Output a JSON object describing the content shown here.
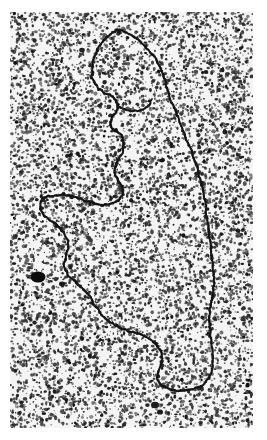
{
  "figure": {
    "kind": "electron-micrograph",
    "title": "",
    "caption": "",
    "background_color": "#ffffff",
    "plate_color": "#f4f4f4",
    "grain_color": "#111111",
    "filament_color": "#141414",
    "canvas": {
      "width": 267,
      "height": 440
    },
    "plate": {
      "x": 10,
      "y": 12,
      "width": 243,
      "height": 416
    }
  },
  "chart_data": {
    "type": "scatter",
    "xlabel": "",
    "ylabel": "",
    "grid": false,
    "legend": "none",
    "xlim": [
      0,
      243
    ],
    "ylim": [
      0,
      416
    ],
    "annotations": [
      "looped DNA filament",
      "top lobe loop",
      "left lower lobe loop",
      "long right arm",
      "dark stain aggregate",
      "granular stain background"
    ],
    "series": [
      {
        "name": "dna-filament-path",
        "type": "line",
        "color": "#141414",
        "width": 2.0,
        "points": [
          [
            108,
            18
          ],
          [
            101,
            22
          ],
          [
            94,
            28
          ],
          [
            88,
            36
          ],
          [
            84,
            45
          ],
          [
            82,
            55
          ],
          [
            82,
            64
          ],
          [
            85,
            72
          ],
          [
            90,
            78
          ],
          [
            96,
            82
          ],
          [
            102,
            84
          ],
          [
            106,
            88
          ],
          [
            108,
            94
          ],
          [
            106,
            100
          ],
          [
            102,
            104
          ],
          [
            100,
            110
          ],
          [
            102,
            116
          ],
          [
            107,
            120
          ],
          [
            112,
            124
          ],
          [
            114,
            131
          ],
          [
            113,
            139
          ],
          [
            110,
            146
          ],
          [
            106,
            152
          ],
          [
            104,
            159
          ],
          [
            106,
            166
          ],
          [
            110,
            171
          ],
          [
            113,
            177
          ],
          [
            112,
            184
          ],
          [
            108,
            189
          ],
          [
            101,
            192
          ],
          [
            93,
            193
          ],
          [
            85,
            192
          ],
          [
            77,
            189
          ],
          [
            69,
            186
          ],
          [
            61,
            184
          ],
          [
            53,
            183
          ],
          [
            45,
            183
          ],
          [
            38,
            184
          ],
          [
            33,
            186
          ],
          [
            30,
            190
          ],
          [
            30,
            196
          ],
          [
            33,
            202
          ],
          [
            38,
            207
          ],
          [
            44,
            211
          ],
          [
            50,
            216
          ],
          [
            55,
            222
          ],
          [
            58,
            229
          ],
          [
            58,
            237
          ],
          [
            56,
            244
          ],
          [
            54,
            251
          ],
          [
            55,
            258
          ],
          [
            59,
            264
          ],
          [
            64,
            269
          ],
          [
            70,
            274
          ],
          [
            76,
            280
          ],
          [
            81,
            287
          ],
          [
            85,
            294
          ],
          [
            90,
            301
          ],
          [
            96,
            307
          ],
          [
            103,
            312
          ],
          [
            110,
            316
          ],
          [
            118,
            319
          ],
          [
            126,
            321
          ],
          [
            134,
            324
          ],
          [
            141,
            328
          ],
          [
            147,
            333
          ],
          [
            151,
            339
          ],
          [
            152,
            346
          ],
          [
            151,
            353
          ],
          [
            148,
            359
          ],
          [
            147,
            366
          ],
          [
            150,
            372
          ],
          [
            156,
            376
          ],
          [
            163,
            378
          ],
          [
            171,
            379
          ],
          [
            179,
            378
          ],
          [
            187,
            376
          ],
          [
            194,
            372
          ],
          [
            199,
            366
          ],
          [
            202,
            359
          ],
          [
            203,
            351
          ],
          [
            203,
            343
          ],
          [
            202,
            335
          ],
          [
            201,
            327
          ],
          [
            200,
            319
          ],
          [
            199,
            311
          ],
          [
            199,
            303
          ],
          [
            200,
            295
          ],
          [
            202,
            287
          ],
          [
            203,
            279
          ],
          [
            204,
            271
          ],
          [
            204,
            263
          ],
          [
            203,
            255
          ],
          [
            202,
            247
          ],
          [
            201,
            239
          ],
          [
            200,
            231
          ],
          [
            199,
            223
          ],
          [
            198,
            215
          ],
          [
            197,
            207
          ],
          [
            196,
            199
          ],
          [
            195,
            191
          ],
          [
            194,
            183
          ],
          [
            192,
            175
          ],
          [
            190,
            167
          ],
          [
            188,
            159
          ],
          [
            186,
            151
          ],
          [
            183,
            143
          ],
          [
            180,
            136
          ],
          [
            177,
            128
          ],
          [
            174,
            121
          ],
          [
            171,
            113
          ],
          [
            168,
            106
          ],
          [
            165,
            98
          ],
          [
            162,
            91
          ],
          [
            159,
            84
          ],
          [
            157,
            76
          ],
          [
            155,
            68
          ],
          [
            152,
            60
          ],
          [
            149,
            53
          ],
          [
            145,
            46
          ],
          [
            140,
            40
          ],
          [
            134,
            34
          ],
          [
            128,
            28
          ],
          [
            121,
            23
          ],
          [
            114,
            19
          ],
          [
            108,
            18
          ]
        ]
      },
      {
        "name": "dna-inner-branch",
        "type": "line",
        "color": "#141414",
        "width": 1.8,
        "points": [
          [
            108,
            94
          ],
          [
            114,
            97
          ],
          [
            121,
            99
          ],
          [
            128,
            99
          ],
          [
            134,
            97
          ],
          [
            139,
            93
          ],
          [
            142,
            87
          ]
        ]
      }
    ],
    "blobs": [
      {
        "name": "stain-aggregate-large",
        "x": 28,
        "y": 265,
        "rx": 7.5,
        "ry": 5.5,
        "color": "#0b0b0b"
      },
      {
        "name": "stain-aggregate-small-a",
        "x": 52,
        "y": 272,
        "rx": 3.0,
        "ry": 2.4,
        "color": "#1a1a1a"
      },
      {
        "name": "stain-aggregate-small-b",
        "x": 145,
        "y": 393,
        "rx": 4.0,
        "ry": 3.2,
        "color": "#1c1c1c"
      },
      {
        "name": "stain-aggregate-small-c",
        "x": 150,
        "y": 400,
        "rx": 3.0,
        "ry": 2.6,
        "color": "#1c1c1c"
      },
      {
        "name": "stain-aggregate-small-d",
        "x": 215,
        "y": 120,
        "rx": 2.6,
        "ry": 2.2,
        "color": "#1f1f1f"
      },
      {
        "name": "stain-aggregate-small-e",
        "x": 72,
        "y": 38,
        "rx": 2.8,
        "ry": 2.2,
        "color": "#1f1f1f"
      },
      {
        "name": "stain-aggregate-small-f",
        "x": 196,
        "y": 60,
        "rx": 2.4,
        "ry": 2.0,
        "color": "#1f1f1f"
      }
    ],
    "smudges": [
      {
        "name": "light-smudge-top-left",
        "x": 34,
        "y": 24,
        "rx": 26,
        "ry": 14,
        "rot": -18,
        "opacity": 0.18
      },
      {
        "name": "light-smudge-top-right",
        "x": 215,
        "y": 30,
        "rx": 20,
        "ry": 12,
        "rot": 10,
        "opacity": 0.12
      },
      {
        "name": "light-smudge-bottom",
        "x": 120,
        "y": 395,
        "rx": 44,
        "ry": 16,
        "rot": 0,
        "opacity": 0.1
      }
    ],
    "grain": {
      "description": "dense high-contrast granular stain speckle covering plate",
      "dot_count": 9000,
      "dot_min_radius": 0.45,
      "dot_max_radius": 1.5,
      "coverage": 0.46,
      "seed": 20240917
    }
  }
}
